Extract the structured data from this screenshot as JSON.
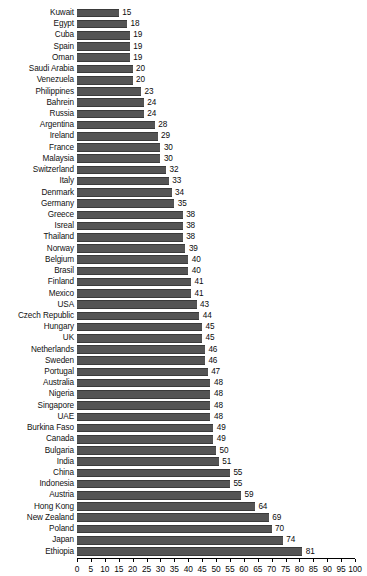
{
  "chart_data": {
    "type": "bar",
    "orientation": "horizontal",
    "title": "",
    "subtitle": "",
    "xlabel": "",
    "ylabel": "",
    "xlim": [
      0,
      100
    ],
    "xticks": [
      0,
      5,
      10,
      15,
      20,
      25,
      30,
      35,
      40,
      45,
      50,
      55,
      60,
      65,
      70,
      75,
      80,
      85,
      90,
      95,
      100
    ],
    "xtick_labels": [
      "0",
      "5",
      "10",
      "15",
      "20",
      "25",
      "30",
      "35",
      "40",
      "45",
      "50",
      "55",
      "60",
      "65",
      "70",
      "75",
      "80",
      "85",
      "90",
      "95",
      "100"
    ],
    "grid": false,
    "legend": false,
    "legend_position": "none",
    "data_labels": true,
    "bar_color": "#545454",
    "axis_color": "#000000",
    "background_color": "#ffffff",
    "categories": [
      "Kuwait",
      "Egypt",
      "Cuba",
      "Spain",
      "Oman",
      "Saudi Arabia",
      "Venezuela",
      "Philippines",
      "Bahrein",
      "Russia",
      "Argentina",
      "Ireland",
      "France",
      "Malaysia",
      "Switzerland",
      "Italy",
      "Denmark",
      "Germany",
      "Greece",
      "Isreal",
      "Thailand",
      "Norway",
      "Belgium",
      "Brasil",
      "Finland",
      "Mexico",
      "USA",
      "Czech Republic",
      "Hungary",
      "UK",
      "Netherlands",
      "Sweden",
      "Portugal",
      "Australia",
      "Nigeria",
      "Singapore",
      "UAE",
      "Burkina Faso",
      "Canada",
      "Bulgaria",
      "India",
      "China",
      "Indonesia",
      "Austria",
      "Hong Kong",
      "New Zealand",
      "Poland",
      "Japan",
      "Ethiopia"
    ],
    "values": [
      15,
      18,
      19,
      19,
      19,
      20,
      20,
      23,
      24,
      24,
      28,
      29,
      30,
      30,
      32,
      33,
      34,
      35,
      38,
      38,
      38,
      39,
      40,
      40,
      41,
      41,
      43,
      44,
      45,
      45,
      46,
      46,
      47,
      48,
      48,
      48,
      48,
      49,
      49,
      50,
      51,
      55,
      55,
      59,
      64,
      69,
      70,
      74,
      81
    ]
  }
}
